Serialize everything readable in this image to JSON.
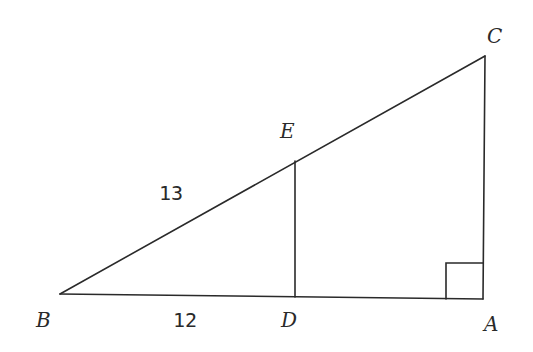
{
  "diagram": {
    "type": "geometry-right-triangle",
    "points": {
      "A": {
        "label": "A",
        "x": 483,
        "y": 299
      },
      "B": {
        "label": "B",
        "x": 60,
        "y": 294
      },
      "C": {
        "label": "C",
        "x": 485,
        "y": 56
      },
      "D": {
        "label": "D",
        "x": 295,
        "y": 297
      },
      "E": {
        "label": "E",
        "x": 295,
        "y": 161
      }
    },
    "segments": [
      {
        "name": "BC",
        "from": "B",
        "to": "C"
      },
      {
        "name": "BA",
        "from": "B",
        "to": "A"
      },
      {
        "name": "CA",
        "from": "C",
        "to": "A"
      },
      {
        "name": "ED",
        "from": "E",
        "to": "D"
      }
    ],
    "measurements": {
      "BE": "13",
      "BD": "12"
    },
    "right_angle_at": "A",
    "stroke_color": "#2a2a2a",
    "background": "#ffffff"
  }
}
